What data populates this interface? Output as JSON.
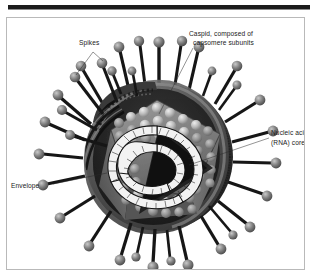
{
  "figure": {
    "background_color": "#ffffff",
    "frame": {
      "rule_color": "#1c1c1c",
      "border_color": "#b9b9b9"
    },
    "palette": {
      "envelope_dark": "#2b2b2b",
      "envelope_mid": "#555555",
      "envelope_light": "#8f8f8f",
      "spike_stalk": "#161616",
      "spike_head": "#6f6f6f",
      "spike_head_highlight": "#bdbdbd",
      "capsid_face": "#6a6a6a",
      "capsomere_light": "#d8d8d8",
      "capsomere_mid": "#a9a9a9",
      "interior_shadow": "#1f1f1f",
      "nucleic_acid": "#f2f2f2",
      "nucleic_acid_outline": "#141414",
      "label_text": "#1a1a1a",
      "leader_line": "#2b2b2b"
    },
    "labels": [
      {
        "id": "spikes",
        "text": "Spikes",
        "lines": [
          "Spikes"
        ],
        "x": 78,
        "y": 42,
        "anchor": "start",
        "points_to": [
          "spike-upper-left",
          "spike-upper-center"
        ]
      },
      {
        "id": "capsid",
        "text": "Caspid, composed of capsomere subunits",
        "lines": [
          "Caspid, composed of",
          "capsomere subunits"
        ],
        "x": 188,
        "y": 33,
        "anchor": "start",
        "points_to": [
          "capsid-shell"
        ]
      },
      {
        "id": "nucleic-acid",
        "text": "Nucleic acid (RNA) core",
        "lines": [
          "Nucleic acid",
          "(RNA) core"
        ],
        "x": 268,
        "y": 120,
        "anchor": "start",
        "points_to": [
          "rna-core"
        ]
      },
      {
        "id": "envelope",
        "text": "Envelope",
        "lines": [
          "Envelope"
        ],
        "x": 10,
        "y": 173,
        "anchor": "start",
        "points_to": [
          "envelope-membrane"
        ]
      }
    ],
    "structures": {
      "envelope": {
        "name": "Envelope",
        "center_x": 158,
        "center_y": 156,
        "radius": 74
      },
      "capsid": {
        "name": "Capsid",
        "subunit_name": "capsomere"
      },
      "core": {
        "name": "Nucleic acid (RNA) core"
      },
      "spike_count": 30
    }
  }
}
